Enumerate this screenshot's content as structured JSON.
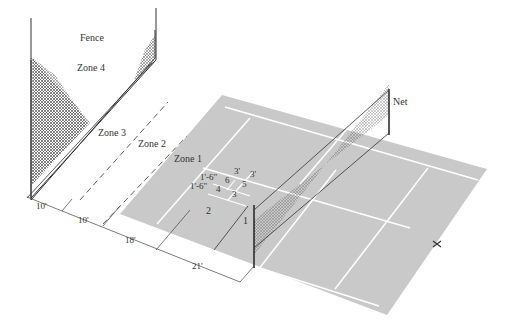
{
  "diagram": {
    "colors": {
      "court": "#c9c9c9",
      "lines": "#ffffff",
      "ink": "#333333",
      "hatch": "#555555"
    },
    "labels": {
      "fence": "Fence",
      "zone4": "Zone 4",
      "zone3": "Zone 3",
      "zone2": "Zone 2",
      "zone1": "Zone 1",
      "net": "Net"
    },
    "subzones": [
      "1",
      "2",
      "3",
      "4",
      "5",
      "6"
    ],
    "box_dims": {
      "top_a": "3'",
      "top_b": "3'",
      "left_a": "1'-6\"",
      "left_b": "1'-6\""
    },
    "dimensions": [
      "10'",
      "10'",
      "18'",
      "21'"
    ]
  }
}
